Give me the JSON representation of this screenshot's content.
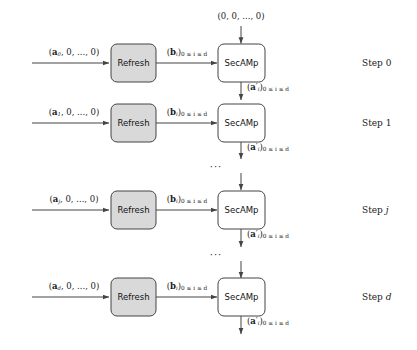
{
  "figure": {
    "type": "block-flow-diagram",
    "width": 417,
    "height": 350,
    "background": "#ffffff",
    "refresh_box_fill": "#d9d9d9",
    "secamp_box_fill": "#ffffff",
    "stroke": "#444444"
  },
  "top_input": {
    "label": "(0, 0, ..., 0)"
  },
  "rows": [
    {
      "input_label_prefix": "(",
      "input_vector": "a",
      "input_index": "0",
      "input_label_suffix": ", 0, ..., 0)",
      "refresh_label": "Refresh",
      "middle_label_base": "b",
      "middle_label_sub": "i",
      "middle_label_range": "0 ≤ i ≤ d",
      "secamp_label": "SecAMp",
      "output_label_base": "a",
      "output_label_prime": "′",
      "output_label_sub": "i",
      "output_label_range": "0 ≤ i ≤ d",
      "step_label": "Step ",
      "step_index": "0"
    },
    {
      "input_label_prefix": "(",
      "input_vector": "a",
      "input_index": "1",
      "input_label_suffix": ", 0, ..., 0)",
      "refresh_label": "Refresh",
      "middle_label_base": "b",
      "middle_label_sub": "i",
      "middle_label_range": "0 ≤ i ≤ d",
      "secamp_label": "SecAMp",
      "output_label_base": "a",
      "output_label_prime": "′",
      "output_label_sub": "i",
      "output_label_range": "0 ≤ i ≤ d",
      "step_label": "Step ",
      "step_index": "1"
    },
    {
      "input_label_prefix": "(",
      "input_vector": "a",
      "input_index": "j",
      "input_label_suffix": ", 0, ..., 0)",
      "refresh_label": "Refresh",
      "middle_label_base": "b",
      "middle_label_sub": "i",
      "middle_label_range": "0 ≤ i ≤ d",
      "secamp_label": "SecAMp",
      "output_label_base": "a",
      "output_label_prime": "′",
      "output_label_sub": "i",
      "output_label_range": "0 ≤ i ≤ d",
      "step_label": "Step ",
      "step_index": "j"
    },
    {
      "input_label_prefix": "(",
      "input_vector": "a",
      "input_index": "d",
      "input_label_suffix": ", 0, ..., 0)",
      "refresh_label": "Refresh",
      "middle_label_base": "b",
      "middle_label_sub": "i",
      "middle_label_range": "0 ≤ i ≤ d",
      "secamp_label": "SecAMp",
      "output_label_base": "a",
      "output_label_prime": "′",
      "output_label_sub": "i",
      "output_label_range": "0 ≤ i ≤ d",
      "step_label": "Step ",
      "step_index": "d"
    }
  ],
  "ellipses": [
    {
      "text": "···"
    },
    {
      "text": "···"
    }
  ]
}
